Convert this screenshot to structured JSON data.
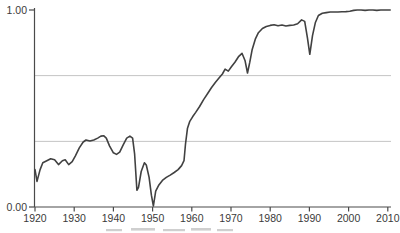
{
  "figure": {
    "background": "#ffffff",
    "colors": {
      "curve": "#414141",
      "axis": "#4a4a4a",
      "grid": "#bdbdbd",
      "tick_label": "#3a3a3a",
      "caption_fragment": "#a9a9a9"
    }
  },
  "chart_data": {
    "type": "line",
    "title": "",
    "xlabel": "",
    "ylabel": "",
    "xlim": [
      1920,
      2010
    ],
    "ylim": [
      0.0,
      1.0
    ],
    "grid": "horizontal-only",
    "legend": "none",
    "x_tick_labels": [
      "1920",
      "1930",
      "1940",
      "1950",
      "1960",
      "1970",
      "1980",
      "1990",
      "2000",
      "2010"
    ],
    "y_tick_labels": [
      "0.00",
      "1.00"
    ],
    "gridlines_y_values": [
      0.333,
      0.667
    ],
    "series": [
      {
        "name": "series-1",
        "points": [
          [
            1920.0,
            0.19
          ],
          [
            1920.5,
            0.13
          ],
          [
            1921.3,
            0.19
          ],
          [
            1922.0,
            0.225
          ],
          [
            1923.0,
            0.235
          ],
          [
            1924.0,
            0.245
          ],
          [
            1925.0,
            0.24
          ],
          [
            1926.0,
            0.215
          ],
          [
            1927.0,
            0.235
          ],
          [
            1927.7,
            0.24
          ],
          [
            1928.6,
            0.215
          ],
          [
            1929.5,
            0.23
          ],
          [
            1930.3,
            0.26
          ],
          [
            1931.3,
            0.3
          ],
          [
            1932.3,
            0.33
          ],
          [
            1933.0,
            0.34
          ],
          [
            1934.0,
            0.335
          ],
          [
            1935.0,
            0.34
          ],
          [
            1936.0,
            0.35
          ],
          [
            1936.8,
            0.36
          ],
          [
            1937.5,
            0.362
          ],
          [
            1938.2,
            0.35
          ],
          [
            1939.0,
            0.31
          ],
          [
            1940.0,
            0.275
          ],
          [
            1940.8,
            0.267
          ],
          [
            1941.6,
            0.278
          ],
          [
            1942.5,
            0.315
          ],
          [
            1943.4,
            0.35
          ],
          [
            1944.2,
            0.36
          ],
          [
            1944.9,
            0.35
          ],
          [
            1945.4,
            0.27
          ],
          [
            1946.0,
            0.085
          ],
          [
            1946.4,
            0.1
          ],
          [
            1947.1,
            0.18
          ],
          [
            1947.9,
            0.225
          ],
          [
            1948.4,
            0.213
          ],
          [
            1949.1,
            0.15
          ],
          [
            1949.7,
            0.06
          ],
          [
            1950.2,
            0.005
          ],
          [
            1950.8,
            0.08
          ],
          [
            1951.6,
            0.112
          ],
          [
            1952.5,
            0.135
          ],
          [
            1953.5,
            0.15
          ],
          [
            1954.5,
            0.162
          ],
          [
            1955.5,
            0.175
          ],
          [
            1956.5,
            0.19
          ],
          [
            1957.4,
            0.21
          ],
          [
            1958.0,
            0.235
          ],
          [
            1958.4,
            0.32
          ],
          [
            1958.9,
            0.4
          ],
          [
            1959.5,
            0.435
          ],
          [
            1960.2,
            0.458
          ],
          [
            1961.0,
            0.48
          ],
          [
            1962.0,
            0.51
          ],
          [
            1963.0,
            0.545
          ],
          [
            1964.0,
            0.575
          ],
          [
            1965.0,
            0.605
          ],
          [
            1966.0,
            0.632
          ],
          [
            1967.0,
            0.656
          ],
          [
            1967.8,
            0.675
          ],
          [
            1968.5,
            0.7
          ],
          [
            1969.3,
            0.69
          ],
          [
            1970.1,
            0.712
          ],
          [
            1971.0,
            0.735
          ],
          [
            1972.0,
            0.765
          ],
          [
            1972.8,
            0.78
          ],
          [
            1973.6,
            0.742
          ],
          [
            1974.2,
            0.68
          ],
          [
            1974.8,
            0.735
          ],
          [
            1975.4,
            0.8
          ],
          [
            1976.2,
            0.852
          ],
          [
            1977.0,
            0.885
          ],
          [
            1978.0,
            0.906
          ],
          [
            1979.0,
            0.916
          ],
          [
            1980.0,
            0.922
          ],
          [
            1981.0,
            0.925
          ],
          [
            1982.0,
            0.92
          ],
          [
            1983.0,
            0.924
          ],
          [
            1984.0,
            0.919
          ],
          [
            1985.0,
            0.922
          ],
          [
            1986.0,
            0.924
          ],
          [
            1987.0,
            0.93
          ],
          [
            1988.0,
            0.95
          ],
          [
            1988.8,
            0.942
          ],
          [
            1989.5,
            0.86
          ],
          [
            1990.1,
            0.775
          ],
          [
            1990.8,
            0.87
          ],
          [
            1991.5,
            0.935
          ],
          [
            1992.3,
            0.972
          ],
          [
            1993.3,
            0.983
          ],
          [
            1994.3,
            0.987
          ],
          [
            1995.3,
            0.99
          ],
          [
            1996.3,
            0.99
          ],
          [
            1997.3,
            0.99
          ],
          [
            1998.3,
            0.991
          ],
          [
            1999.3,
            0.992
          ],
          [
            2000.3,
            0.994
          ],
          [
            2001.3,
            0.998
          ],
          [
            2002.2,
            1.0
          ],
          [
            2003.2,
            1.0
          ],
          [
            2004.2,
            0.998
          ],
          [
            2005.2,
            1.0
          ],
          [
            2006.2,
            1.0
          ],
          [
            2007.2,
            0.998
          ],
          [
            2008.2,
            1.0
          ],
          [
            2009.2,
            1.0
          ],
          [
            2010.6,
            1.0
          ]
        ]
      }
    ]
  }
}
